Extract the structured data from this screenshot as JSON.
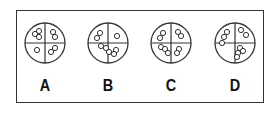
{
  "figure": {
    "options": [
      {
        "label": "A",
        "cx": 45,
        "cy": 43,
        "r": 20,
        "dots": [
          [
            -10,
            -9
          ],
          [
            -6,
            -12
          ],
          [
            -6,
            -6
          ],
          [
            8,
            -11
          ],
          [
            10,
            -6
          ],
          [
            -8,
            7
          ],
          [
            6,
            9
          ],
          [
            10,
            5
          ]
        ]
      },
      {
        "label": "B",
        "cx": 108,
        "cy": 43,
        "r": 20,
        "dots": [
          [
            -8,
            -10
          ],
          [
            -11,
            -5
          ],
          [
            9,
            -7
          ],
          [
            -7,
            3
          ],
          [
            -2,
            5
          ],
          [
            1,
            9
          ],
          [
            8,
            7
          ],
          [
            6,
            11
          ]
        ]
      },
      {
        "label": "C",
        "cx": 171,
        "cy": 43,
        "r": 20,
        "dots": [
          [
            -8,
            -10
          ],
          [
            -11,
            -5
          ],
          [
            7,
            -11
          ],
          [
            10,
            -7
          ],
          [
            -10,
            4
          ],
          [
            -6,
            6
          ],
          [
            -3,
            10
          ],
          [
            8,
            6
          ],
          [
            6,
            10
          ]
        ]
      },
      {
        "label": "D",
        "cx": 235,
        "cy": 43,
        "r": 20,
        "dots": [
          [
            -8,
            -11
          ],
          [
            -11,
            -6
          ],
          [
            -13,
            0
          ],
          [
            6,
            -13
          ],
          [
            11,
            -8
          ],
          [
            5,
            5
          ],
          [
            8,
            8
          ],
          [
            3,
            10
          ],
          [
            2,
            14
          ]
        ]
      }
    ],
    "stroke_color": "#333333"
  }
}
